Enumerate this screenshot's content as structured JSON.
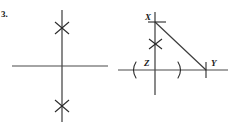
{
  "page": {
    "width": 231,
    "height": 128,
    "background": "#ffffff",
    "ink_color": "#3b3b3b",
    "label_color": "#1a1a1a"
  },
  "problem": {
    "number_label": "3."
  },
  "figures": [
    {
      "id": "left-figure",
      "name": "perpendicular-lines-figure",
      "description": "Two perpendicular lines crossing, with congruence tick marks on the upper and lower parts of the vertical line",
      "vertical_line": {
        "x": 62,
        "y1": 10,
        "y2": 122
      },
      "horizontal_line": {
        "y": 66,
        "x1": 12,
        "x2": 108
      },
      "marks": [
        {
          "name": "congruence-mark-upper",
          "x": 62,
          "y": 28,
          "type": "x-cross"
        },
        {
          "name": "congruence-mark-lower",
          "x": 62,
          "y": 106,
          "type": "x-cross"
        }
      ]
    },
    {
      "id": "right-figure",
      "name": "right-triangle-xzy-figure",
      "description": "Right triangle X Z Y drawn on perpendicular axes with congruence tick marks on the vertical leg and arc marks on the horizontal leg",
      "vertical_line": {
        "x": 155,
        "y1": 12,
        "y2": 95
      },
      "horizontal_line": {
        "y": 70,
        "x1": 118,
        "x2": 228
      },
      "hypotenuse": {
        "x1": 155,
        "y1": 22,
        "x2": 206,
        "y2": 70
      },
      "vertices": [
        {
          "name": "vertex-x",
          "label": "X",
          "x": 155,
          "y": 22,
          "label_x": 145,
          "label_y": 20
        },
        {
          "name": "vertex-z",
          "label": "Z",
          "x": 155,
          "y": 70,
          "label_x": 144,
          "label_y": 64
        },
        {
          "name": "vertex-y",
          "label": "Y",
          "x": 206,
          "y": 70,
          "label_x": 212,
          "label_y": 64
        }
      ],
      "marks": [
        {
          "name": "tick-mark-at-x",
          "x": 155,
          "y": 22,
          "type": "horizontal-tick"
        },
        {
          "name": "congruence-mark-vertical-leg",
          "x": 155,
          "y": 44,
          "type": "x-cross"
        },
        {
          "name": "tick-mark-at-y",
          "x": 206,
          "y": 70,
          "type": "vertical-tick"
        },
        {
          "name": "arc-mark-left",
          "x": 133,
          "y": 70,
          "type": "left-paren-arc"
        },
        {
          "name": "arc-mark-right",
          "x": 180,
          "y": 70,
          "type": "right-paren-arc"
        }
      ]
    }
  ]
}
